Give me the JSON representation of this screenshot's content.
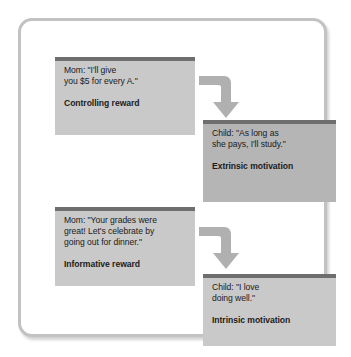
{
  "figure": {
    "frame_border_color": "#c2c2c2",
    "background_color": "#ffffff"
  },
  "palette": {
    "box_light": "#c9c9c9",
    "box_dark": "#b5b5b5",
    "box_top_bar": "#6e6e6e",
    "arrow": "#b0b0b0",
    "text": "#1b1b1b"
  },
  "nodes": [
    {
      "id": "controlling-reward",
      "role": "mom",
      "column": "left",
      "row": 1,
      "tone": "light",
      "quote": "Mom: \"I'll give\nyou $5 for every A.\"",
      "label": "Controlling reward"
    },
    {
      "id": "extrinsic-motivation",
      "role": "child",
      "column": "right",
      "row": 1,
      "tone": "dark",
      "quote": "Child: \"As long as\nshe pays, I'll study.\"",
      "label": "Extrinsic motivation"
    },
    {
      "id": "informative-reward",
      "role": "mom",
      "column": "left",
      "row": 2,
      "tone": "light",
      "quote": "Mom: \"Your grades were\ngreat!  Let's celebrate by\ngoing out for dinner.\"",
      "label": "Informative reward"
    },
    {
      "id": "intrinsic-motivation",
      "role": "child",
      "column": "right",
      "row": 2,
      "tone": "light",
      "quote": "Child: \"I love\ndoing well.\"",
      "label": "Intrinsic motivation"
    }
  ],
  "arrows": [
    {
      "id": "controlling-to-extrinsic",
      "from": "controlling-reward",
      "to": "extrinsic-motivation",
      "shape": "elbow-right-down"
    },
    {
      "id": "informative-to-intrinsic",
      "from": "informative-reward",
      "to": "intrinsic-motivation",
      "shape": "elbow-right-down"
    }
  ]
}
